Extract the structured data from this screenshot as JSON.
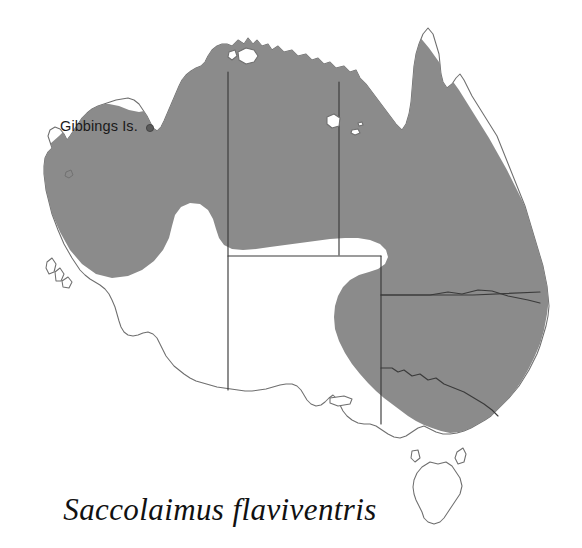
{
  "figure": {
    "type": "distribution-map",
    "region": "Australia",
    "background_color": "#ffffff",
    "species_name": "Saccolaimus flaviventris",
    "range_fill_color": "#8b8b8b",
    "coast_outline_color": "#6e6e6e",
    "state_border_color": "#3a3a3a",
    "land_fill_color": "#ffffff"
  },
  "annotations": {
    "locality": {
      "label": "Gibbings Is.",
      "marker": "locality-dot",
      "marker_color": "#5a5a5a"
    }
  },
  "map_content": {
    "shaded_description": "Northern and eastern Australia distribution",
    "shaded_states": [
      "Western Australia (northern)",
      "Northern Territory",
      "Queensland",
      "New South Wales",
      "Victoria (eastern)",
      "South Australia (north-eastern margin)"
    ],
    "unshaded_states": [
      "Western Australia (southern)",
      "South Australia (southern)",
      "Tasmania"
    ],
    "named_islands": [
      "Gibbings Is.",
      "Melville Island",
      "Groote Eylandt",
      "Kangaroo Island",
      "King Island",
      "Tasmania"
    ],
    "state_boundaries": [
      "WA / NT",
      "NT / QLD",
      "WA / SA",
      "NT / SA",
      "SA / QLD",
      "SA / NSW",
      "QLD / NSW",
      "NSW / VIC"
    ]
  }
}
